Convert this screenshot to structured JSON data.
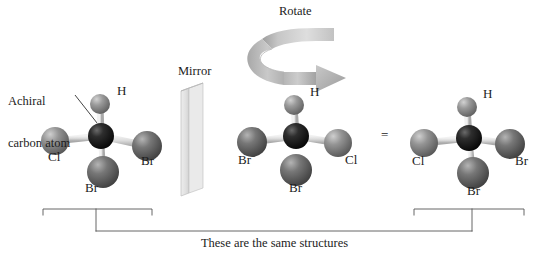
{
  "figure": {
    "caption": "These are the same structures",
    "annotation_label_line1": "Achiral",
    "annotation_label_line2": "carbon atom",
    "mirror_label": "Mirror",
    "rotate_label": "Rotate",
    "equals_sign": "="
  },
  "colors": {
    "background": "#ffffff",
    "carbon": "#161616",
    "hydrogen": "#8e8e8e",
    "chlorine": "#8a8a8a",
    "bromine": "#6e6e6e",
    "bond": "#d8d8d8",
    "line": "#4a4a4a",
    "mirror_face": "#e3e3e3",
    "mirror_edge": "#b9b9b9",
    "arrow_light": "#d7d7d7",
    "arrow_dark": "#9a9a9a",
    "text": "#1c1c1c"
  },
  "molecules": [
    {
      "id": "molecule-left",
      "name": "original-structure",
      "center": {
        "x": 101,
        "y": 136
      },
      "atoms": [
        {
          "element": "C",
          "label": "",
          "x": 101,
          "y": 136,
          "r": 13,
          "color_key": "carbon"
        },
        {
          "element": "H",
          "label": "H",
          "x": 100,
          "y": 104,
          "r": 10,
          "color_key": "hydrogen",
          "label_x": 118,
          "label_y": 88
        },
        {
          "element": "Cl",
          "label": "Cl",
          "x": 55,
          "y": 141,
          "r": 14,
          "color_key": "chlorine",
          "label_x": 50,
          "label_y": 154
        },
        {
          "element": "Br",
          "label": "Br",
          "x": 147,
          "y": 146,
          "r": 15,
          "color_key": "bromine",
          "label_x": 143,
          "label_y": 157
        },
        {
          "element": "Br",
          "label": "Br",
          "x": 103,
          "y": 172,
          "r": 16,
          "color_key": "bromine",
          "label_x": 88,
          "label_y": 184
        }
      ]
    },
    {
      "id": "molecule-middle",
      "name": "mirror-image-structure",
      "center": {
        "x": 296,
        "y": 136
      },
      "atoms": [
        {
          "element": "C",
          "label": "",
          "x": 296,
          "y": 136,
          "r": 13,
          "color_key": "carbon"
        },
        {
          "element": "H",
          "label": "H",
          "x": 294,
          "y": 105,
          "r": 10,
          "color_key": "hydrogen",
          "label_x": 311,
          "label_y": 89
        },
        {
          "element": "Br",
          "label": "Br",
          "x": 252,
          "y": 142,
          "r": 15,
          "color_key": "bromine",
          "label_x": 240,
          "label_y": 156
        },
        {
          "element": "Cl",
          "label": "Cl",
          "x": 338,
          "y": 143,
          "r": 14,
          "color_key": "chlorine",
          "label_x": 347,
          "label_y": 156
        },
        {
          "element": "Br",
          "label": "Br",
          "x": 296,
          "y": 170,
          "r": 16,
          "color_key": "bromine",
          "label_x": 292,
          "label_y": 184
        }
      ]
    },
    {
      "id": "molecule-right",
      "name": "rotated-structure",
      "center": {
        "x": 469,
        "y": 138
      },
      "atoms": [
        {
          "element": "C",
          "label": "",
          "x": 469,
          "y": 138,
          "r": 13,
          "color_key": "carbon"
        },
        {
          "element": "H",
          "label": "H",
          "x": 467,
          "y": 107,
          "r": 10,
          "color_key": "hydrogen",
          "label_x": 484,
          "label_y": 91
        },
        {
          "element": "Cl",
          "label": "Cl",
          "x": 424,
          "y": 143,
          "r": 14,
          "color_key": "chlorine",
          "label_x": 414,
          "label_y": 157
        },
        {
          "element": "Br",
          "label": "Br",
          "x": 510,
          "y": 144,
          "r": 15,
          "color_key": "bromine",
          "label_x": 516,
          "label_y": 157
        },
        {
          "element": "Br",
          "label": "Br",
          "x": 473,
          "y": 173,
          "r": 16,
          "color_key": "bromine",
          "label_x": 470,
          "label_y": 187
        }
      ]
    }
  ],
  "brackets": {
    "left": {
      "x1": 43,
      "x2": 152,
      "y": 209,
      "stem_x": 96,
      "stem_y": 231
    },
    "right": {
      "x1": 414,
      "x2": 524,
      "y": 209,
      "stem_x": 472,
      "stem_y": 231
    },
    "connector_y": 231
  },
  "mirror_plane": {
    "label_x": 180,
    "label_y": 66,
    "top_front_x": 181,
    "top_front_y": 91,
    "top_back_x": 203,
    "top_back_y": 83,
    "bottom_front_x": 181,
    "bottom_front_y": 196,
    "bottom_back_x": 203,
    "bottom_back_y": 188
  },
  "rotate_arrow": {
    "label_x": 281,
    "label_y": 6
  },
  "annotation_leader": {
    "x1": 75,
    "y1": 95,
    "x2": 101,
    "y2": 128
  }
}
